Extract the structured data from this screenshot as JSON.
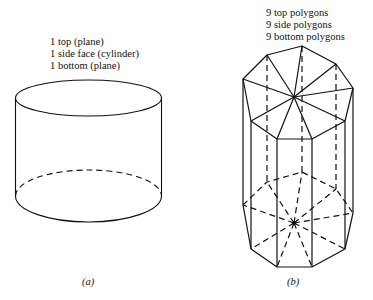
{
  "figure_a": {
    "caption_lines": [
      "1 top (plane)",
      "1 side face (cylinder)",
      "1 bottom (plane)"
    ],
    "label": "(a)"
  },
  "figure_b": {
    "caption_lines": [
      "9 top polygons",
      "9 side polygons",
      "9 bottom polygons"
    ],
    "label": "(b)"
  },
  "colors": {
    "line": "#111111",
    "background": "#ffffff"
  }
}
